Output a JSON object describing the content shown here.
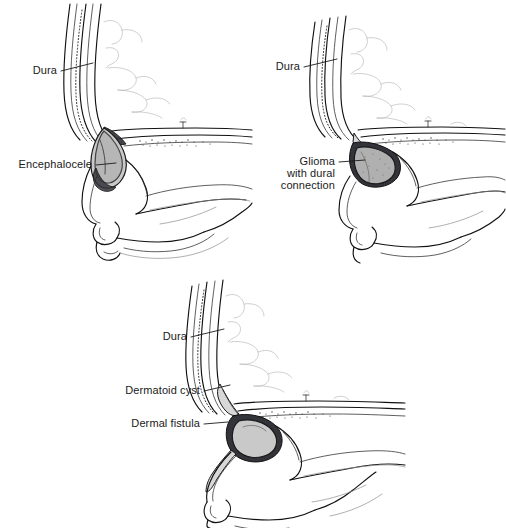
{
  "figure": {
    "background_color": "#ffffff",
    "ink_color": "#111111",
    "label_color": "#1a1a1a",
    "width": 506,
    "height": 528,
    "style": "medical line illustration, sagittal section of anterior skull base and nasal region"
  },
  "panels": [
    {
      "id": "encephalocele",
      "name": "Encephalocele",
      "position": "top-left",
      "labels": [
        {
          "text": "Dura",
          "anchor": "end",
          "x": 57,
          "y": 74
        },
        {
          "text": "Encephalocele",
          "anchor": "end",
          "x": 92,
          "y": 168
        }
      ]
    },
    {
      "id": "glioma",
      "name": "Glioma with dural connection",
      "position": "top-right",
      "labels": [
        {
          "text": "Dura",
          "anchor": "end",
          "x": 47,
          "y": 70
        },
        {
          "text": "Glioma",
          "anchor": "end",
          "x": 82,
          "y": 165
        },
        {
          "text": "with dural",
          "anchor": "end",
          "x": 82,
          "y": 177
        },
        {
          "text": "connection",
          "anchor": "end",
          "x": 82,
          "y": 189
        }
      ]
    },
    {
      "id": "dermatoid",
      "name": "Dermatoid cyst with dermal fistula",
      "position": "bottom-center",
      "labels": [
        {
          "text": "Dura",
          "anchor": "end",
          "x": 87,
          "y": 76
        },
        {
          "text": "Dermatoid cyst",
          "anchor": "end",
          "x": 100,
          "y": 130
        },
        {
          "text": "Dermal fistula",
          "anchor": "end",
          "x": 100,
          "y": 163
        }
      ]
    }
  ],
  "colors": {
    "mass_light": "#c9c9c9",
    "mass_mid": "#b0b0b0",
    "mass_dark": "#6e6e6e",
    "mass_deep": "#33333a",
    "tract": "#d8d8d8",
    "ink": "#111111",
    "background": "#ffffff"
  }
}
